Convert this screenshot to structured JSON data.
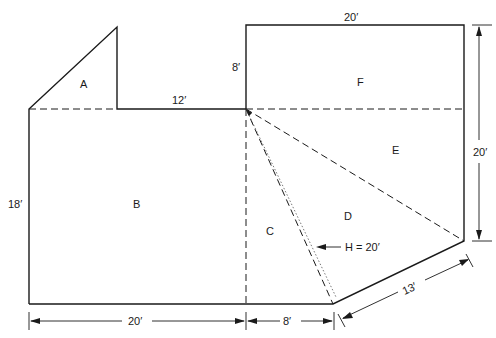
{
  "diagram": {
    "type": "floor-plan-area-decomposition",
    "regions": [
      {
        "id": "A",
        "shape": "right-triangle"
      },
      {
        "id": "B",
        "shape": "rectangle"
      },
      {
        "id": "C",
        "shape": "triangle"
      },
      {
        "id": "D",
        "shape": "triangle"
      },
      {
        "id": "E",
        "shape": "triangle"
      },
      {
        "id": "F",
        "shape": "rectangle"
      }
    ],
    "labels": {
      "A": "A",
      "B": "B",
      "C": "C",
      "D": "D",
      "E": "E",
      "F": "F"
    },
    "dimensions": {
      "top_f_width": "20′",
      "f_height": "8′",
      "a_to_f_span": "12′",
      "b_height": "18′",
      "right_height": "20′",
      "bottom_b_width": "20′",
      "bottom_c_width": "8′",
      "diagonal_bottom": "13′",
      "height_d": "H = 20′"
    }
  }
}
